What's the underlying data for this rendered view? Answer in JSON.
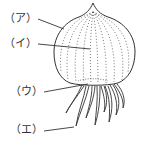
{
  "diagram": {
    "labels": [
      {
        "id": "a",
        "text": "（ア）"
      },
      {
        "id": "i",
        "text": "（イ）"
      },
      {
        "id": "u",
        "text": "（ウ）"
      },
      {
        "id": "e",
        "text": "（エ）"
      }
    ],
    "colors": {
      "line": "#333333",
      "background": "#ffffff"
    }
  }
}
